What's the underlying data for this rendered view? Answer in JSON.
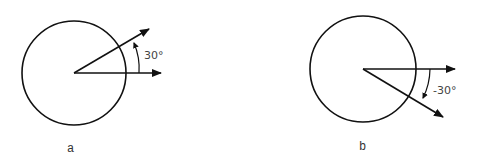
{
  "figure": {
    "panels": [
      {
        "id": "a",
        "caption": "a",
        "angle_label": "30°",
        "angle_deg": 30,
        "description": "Circle with reference vector along +x and a second vector rotated counterclockwise by 30°"
      },
      {
        "id": "b",
        "caption": "b",
        "angle_label": "-30°",
        "angle_deg": -30,
        "description": "Circle with reference vector along +x and a second vector rotated clockwise by 30°"
      }
    ],
    "colors": {
      "stroke": "#111111",
      "label": "#444444",
      "background": "#ffffff"
    }
  }
}
